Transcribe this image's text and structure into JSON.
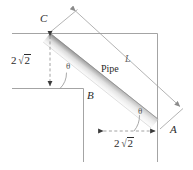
{
  "figure": {
    "title_text": "Pipe sliding geometry diagram",
    "pipe_label": "Pipe",
    "length_label": "L",
    "points": {
      "a": "A",
      "b": "B",
      "c": "C"
    },
    "angles": {
      "at_b": "θ",
      "at_a": "θ"
    },
    "dimensions": {
      "vertical": {
        "coefficient": "2",
        "radicand": "2",
        "full": "2√2"
      },
      "horizontal": {
        "coefficient": "2",
        "radicand": "2",
        "full": "2√2"
      }
    },
    "colors": {
      "wall_line": "#9a9a9a",
      "dim_line": "#8a8a8a",
      "pipe_dark": "#9d9d9d",
      "pipe_light": "#f2f2f2",
      "text": "#2b2b2b",
      "background": "#ffffff"
    },
    "icons": {
      "arrow_down": "arrow-down-icon",
      "arrow_up": "arrow-up-icon",
      "arrow_left": "arrow-left-icon",
      "arrow_right": "arrow-right-icon"
    }
  }
}
